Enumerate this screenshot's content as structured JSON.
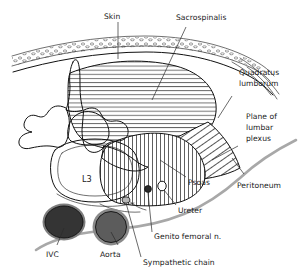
{
  "figure": {
    "background_color": "#ffffff",
    "ink_color": "#111111",
    "peritoneum_color": "#a8a8a8"
  },
  "labels": {
    "skin": "Skin",
    "sacrospinalis": "Sacrospinalis",
    "quadratus_lumborum_line1": "Quadratus",
    "quadratus_lumborum_line2": "lumborum",
    "plane_of_lumbar_plexus_line1": "Plane of",
    "plane_of_lumbar_plexus_line2": "lumbar",
    "plane_of_lumbar_plexus_line3": "plexus",
    "peritoneum": "Peritoneum",
    "psoas": "Psoas",
    "ureter": "Ureter",
    "genito_femoral_nerve": "Genito femoral n.",
    "sympathetic_chain": "Sympathetic chain",
    "ivc": "IVC",
    "aorta": "Aorta",
    "vertebral_body": "L3"
  },
  "structures": {
    "ivc": {
      "name": "Inferior vena cava",
      "fill": "#3a3a3a",
      "rim": "#777777"
    },
    "aorta": {
      "name": "Aorta",
      "fill": "#555555",
      "rim": "#8a8a8a"
    },
    "sacrospinalis": {
      "hatch": "horizontal"
    },
    "quadratus_lumborum": {
      "hatch": "diagonal"
    },
    "psoas": {
      "hatch": "vertical"
    }
  }
}
